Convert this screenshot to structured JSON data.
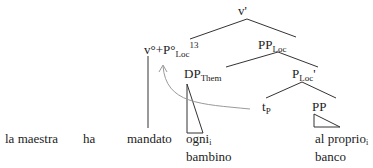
{
  "tree": {
    "root": {
      "label": "v'"
    },
    "head": {
      "label": "v°+P°",
      "sub": "Loc",
      "sup": "13"
    },
    "pp_loc": {
      "label": "PP",
      "sub": "Loc"
    },
    "dp_them": {
      "label": "DP",
      "sub": "Them"
    },
    "p_loc_bar": {
      "label": "P",
      "sub": "Loc",
      "prime": "'"
    },
    "trace": {
      "label": "t",
      "sub": "P"
    },
    "pp": {
      "label": "PP"
    }
  },
  "sentence": {
    "words": [
      {
        "text": "la maestra"
      },
      {
        "text": "ha"
      },
      {
        "text": "mandato"
      },
      {
        "text": "ogni",
        "sub": "i",
        "line2": "bambino"
      },
      {
        "text": "al proprio",
        "sub": "i",
        "line2": "banco"
      }
    ]
  },
  "colors": {
    "lines": "#333333",
    "arrow": "#9a9a9a"
  }
}
